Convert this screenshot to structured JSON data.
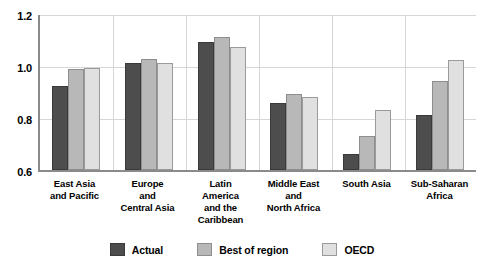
{
  "chart_data": {
    "type": "bar",
    "title": "",
    "subtitle": "",
    "xlabel": "",
    "ylabel": "",
    "ylim": [
      0.6,
      1.2
    ],
    "yticks": [
      "0.6",
      "0.8",
      "1.0",
      "1.2"
    ],
    "ytick_values": [
      0.6,
      0.8,
      1.0,
      1.2
    ],
    "grid": true,
    "legend_position": "bottom",
    "categories": [
      "East Asia and Pacific",
      "Europe and Central Asia",
      "Latin America and the Caribbean",
      "Middle East and North Africa",
      "South Asia",
      "Sub-Saharan Africa"
    ],
    "category_lines": [
      [
        "East Asia",
        "and Pacific"
      ],
      [
        "Europe",
        "and",
        "Central Asia"
      ],
      [
        "Latin",
        "America",
        "and the",
        "Caribbean"
      ],
      [
        "Middle East",
        "and",
        "North Africa"
      ],
      [
        "South Asia"
      ],
      [
        "Sub-Saharan",
        "Africa"
      ]
    ],
    "series": [
      {
        "name": "Actual",
        "color": "#4d4d4d",
        "values": [
          0.92,
          1.01,
          1.09,
          0.855,
          0.66,
          0.81
        ]
      },
      {
        "name": "Best of region",
        "color": "#b8b8b8",
        "values": [
          0.985,
          1.025,
          1.11,
          0.89,
          0.73,
          0.94
        ]
      },
      {
        "name": "OECD",
        "color": "#e0e0e0",
        "values": [
          0.99,
          1.01,
          1.07,
          0.88,
          0.83,
          1.02
        ]
      }
    ]
  }
}
